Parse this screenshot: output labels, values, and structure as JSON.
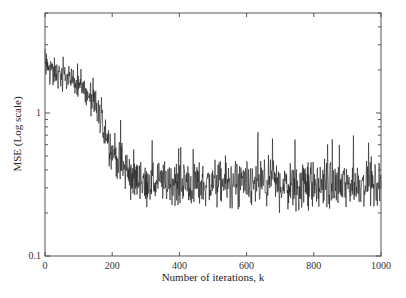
{
  "chart_data": {
    "type": "line",
    "title": "",
    "xlabel": "Number of iterations, k",
    "ylabel": "MSE (Log scale)",
    "xlim": [
      0,
      1000
    ],
    "ylim": [
      0.1,
      5
    ],
    "yscale": "log",
    "grid": false,
    "legend": null,
    "x_ticks": [
      0,
      200,
      400,
      600,
      800,
      1000
    ],
    "x_tick_labels": [
      "0",
      "200",
      "400",
      "600",
      "800",
      "1000"
    ],
    "y_ticks": [
      0.1,
      1
    ],
    "y_tick_labels": [
      "0.1",
      "1"
    ],
    "series": [
      {
        "name": "MSE",
        "color": "#1a1a1a",
        "description": "Noisy learning curve: starts near 2.0, decays after k≈100 to about 0.33 by k≈250, then fluctuates around 0.3–0.35 (range ≈0.2–0.8) through k=1000",
        "x": [
          0,
          50,
          100,
          150,
          200,
          250,
          300,
          400,
          500,
          600,
          700,
          800,
          900,
          1000
        ],
        "values": [
          2.1,
          1.8,
          1.6,
          1.1,
          0.55,
          0.36,
          0.33,
          0.32,
          0.32,
          0.31,
          0.32,
          0.31,
          0.32,
          0.33
        ],
        "noise_range_low": [
          1.4,
          1.3,
          1.1,
          0.7,
          0.35,
          0.25,
          0.22,
          0.21,
          0.22,
          0.21,
          0.2,
          0.21,
          0.22,
          0.22
        ],
        "noise_range_high": [
          3.0,
          2.5,
          2.2,
          1.7,
          1.0,
          0.8,
          0.7,
          0.65,
          0.7,
          0.75,
          0.7,
          0.72,
          0.7,
          0.68
        ]
      }
    ]
  },
  "axes": {
    "x_title": "Number of iterations, k",
    "y_title": "MSE (Log scale)"
  }
}
